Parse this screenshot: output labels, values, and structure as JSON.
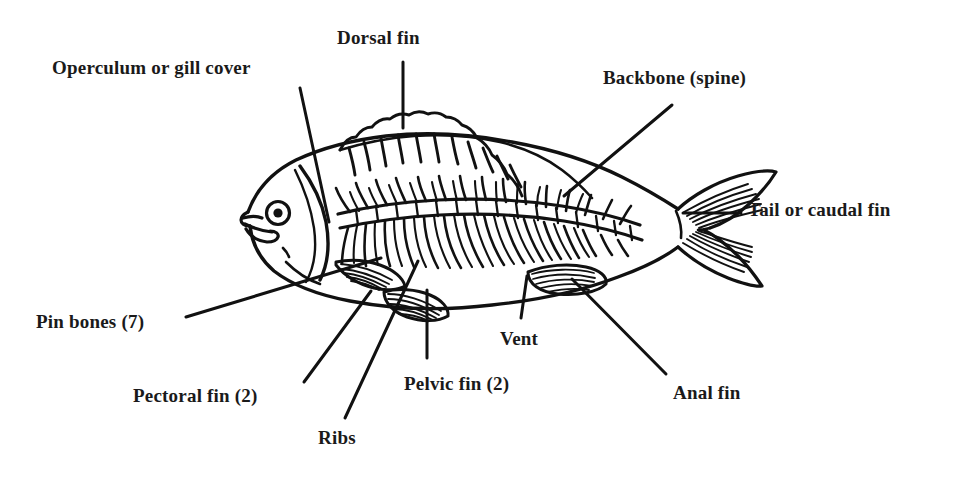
{
  "diagram": {
    "style": "black-and-white line drawing",
    "background_color": "#ffffff",
    "ink_color": "#111111",
    "labels": [
      {
        "id": "operculum",
        "text": "Operculum or gill cover",
        "x": 52,
        "y": 58,
        "leader": {
          "x1": 300,
          "y1": 88,
          "x2": 329,
          "y2": 222
        }
      },
      {
        "id": "dorsal-fin",
        "text": "Dorsal  fin",
        "x": 337,
        "y": 28,
        "leader": {
          "x1": 403,
          "y1": 62,
          "x2": 403,
          "y2": 128
        }
      },
      {
        "id": "backbone",
        "text": "Backbone (spine)",
        "x": 603,
        "y": 68,
        "leader": {
          "x1": 672,
          "y1": 105,
          "x2": 564,
          "y2": 196
        }
      },
      {
        "id": "tail-caudal-fin",
        "text": "Tail or caudal fin",
        "x": 748,
        "y": 200,
        "leader": {
          "x1": 741,
          "y1": 213,
          "x2": 683,
          "y2": 213
        }
      },
      {
        "id": "pin-bones",
        "text": "Pin bones (7)",
        "x": 36,
        "y": 312,
        "leader": {
          "x1": 186,
          "y1": 317,
          "x2": 381,
          "y2": 258
        }
      },
      {
        "id": "pectoral-fin",
        "text": "Pectoral  fin (2)",
        "x": 133,
        "y": 386,
        "leader": {
          "x1": 304,
          "y1": 382,
          "x2": 371,
          "y2": 291
        }
      },
      {
        "id": "ribs",
        "text": "Ribs",
        "x": 318,
        "y": 428,
        "leader": {
          "x1": 345,
          "y1": 418,
          "x2": 418,
          "y2": 261
        }
      },
      {
        "id": "pelvic-fin",
        "text": "Pelvic fin (2)",
        "x": 404,
        "y": 374,
        "leader": {
          "x1": 427,
          "y1": 358,
          "x2": 427,
          "y2": 290
        }
      },
      {
        "id": "vent",
        "text": "Vent",
        "x": 500,
        "y": 329,
        "leader": {
          "x1": 521,
          "y1": 318,
          "x2": 527,
          "y2": 276
        }
      },
      {
        "id": "anal-fin",
        "text": "Anal  fin",
        "x": 673,
        "y": 383,
        "leader": {
          "x1": 666,
          "y1": 374,
          "x2": 572,
          "y2": 279
        }
      }
    ]
  }
}
